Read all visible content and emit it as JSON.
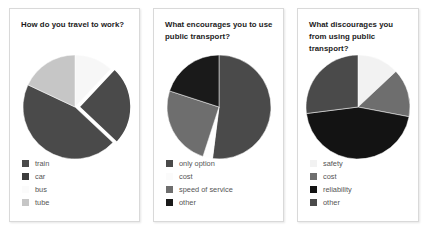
{
  "page": {
    "background_color": "#ffffff",
    "card_border_color": "#d9d9d9"
  },
  "charts": [
    {
      "id": "travel-to-work",
      "title": "How do you travel to work?",
      "chart_data": {
        "type": "pie",
        "title": "How do you travel to work?",
        "xlabel": "",
        "ylabel": "",
        "legend_position": "bottom-left",
        "grid": false,
        "start_angle": 0,
        "categories": [
          "bus",
          "car",
          "train",
          "tube"
        ],
        "values": [
          12,
          25,
          45,
          18
        ],
        "slices": [
          {
            "label": "bus",
            "value": 12,
            "color": "#f7f7f7",
            "exploded": false
          },
          {
            "label": "car",
            "value": 25,
            "color": "#4a4a4a",
            "exploded": true
          },
          {
            "label": "train",
            "value": 45,
            "color": "#4a4a4a",
            "exploded": false
          },
          {
            "label": "tube",
            "value": 18,
            "color": "#c6c6c6",
            "exploded": false
          }
        ],
        "legend_order": [
          "train",
          "car",
          "bus",
          "tube"
        ]
      },
      "legend": [
        {
          "label": "train",
          "color": "#4a4a4a"
        },
        {
          "label": "car",
          "color": "#3d3d3d"
        },
        {
          "label": "bus",
          "color": "#fbfbfb"
        },
        {
          "label": "tube",
          "color": "#c6c6c6"
        }
      ]
    },
    {
      "id": "encourages-public-transport",
      "title": "What encourages you to use public transport?",
      "chart_data": {
        "type": "pie",
        "title": "What encourages you to use public transport?",
        "xlabel": "",
        "ylabel": "",
        "legend_position": "bottom-left",
        "grid": false,
        "start_angle": 0,
        "categories": [
          "only option",
          "cost",
          "speed of service",
          "other"
        ],
        "values": [
          52,
          3,
          25,
          20
        ],
        "slices": [
          {
            "label": "only option",
            "value": 52,
            "color": "#4a4a4a",
            "exploded": false
          },
          {
            "label": "cost",
            "value": 3,
            "color": "#fdfdfd",
            "exploded": false
          },
          {
            "label": "speed of service",
            "value": 25,
            "color": "#6e6e6e",
            "exploded": false
          },
          {
            "label": "other",
            "value": 20,
            "color": "#1a1a1a",
            "exploded": false
          }
        ],
        "legend_order": [
          "only option",
          "cost",
          "speed of service",
          "other"
        ]
      },
      "legend": [
        {
          "label": "only option",
          "color": "#4a4a4a"
        },
        {
          "label": "cost",
          "color": "#fbfbfb"
        },
        {
          "label": "speed of service",
          "color": "#6e6e6e"
        },
        {
          "label": "other",
          "color": "#1a1a1a"
        }
      ]
    },
    {
      "id": "discourages-public-transport",
      "title": "What discourages you from using public transport?",
      "chart_data": {
        "type": "pie",
        "title": "What discourages you from using public transport?",
        "xlabel": "",
        "ylabel": "",
        "legend_position": "bottom-left",
        "grid": false,
        "start_angle": 0,
        "categories": [
          "safety",
          "cost",
          "reliability",
          "other"
        ],
        "values": [
          13,
          15,
          45,
          27
        ],
        "slices": [
          {
            "label": "safety",
            "value": 13,
            "color": "#f2f2f2",
            "exploded": false
          },
          {
            "label": "cost",
            "value": 15,
            "color": "#6e6e6e",
            "exploded": false
          },
          {
            "label": "reliability",
            "value": 45,
            "color": "#131313",
            "exploded": false
          },
          {
            "label": "other",
            "value": 27,
            "color": "#4a4a4a",
            "exploded": false
          }
        ],
        "legend_order": [
          "safety",
          "cost",
          "reliability",
          "other"
        ]
      },
      "legend": [
        {
          "label": "safety",
          "color": "#f2f2f2"
        },
        {
          "label": "cost",
          "color": "#6e6e6e"
        },
        {
          "label": "reliability",
          "color": "#131313"
        },
        {
          "label": "other",
          "color": "#4a4a4a"
        }
      ]
    }
  ]
}
